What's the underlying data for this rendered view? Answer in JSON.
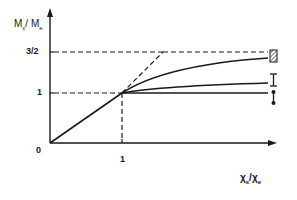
{
  "diagram": {
    "y_axis_label": "M",
    "y_axis_label_sub_num": "x",
    "y_axis_label_sep": "/ M",
    "y_axis_label_sub_den": "e",
    "x_axis_label": "χ",
    "x_axis_label_sub_num": "x",
    "x_axis_label_sep": "/χ",
    "x_axis_label_sub_den": "e",
    "y_ticks": [
      "3/2",
      "1"
    ],
    "x_ticks": [
      "1"
    ],
    "origin_label": "0",
    "legend_symbols": [
      {
        "name": "hatched-box-symbol",
        "level": "top curve"
      },
      {
        "name": "i-beam-symbol",
        "level": "middle curve"
      },
      {
        "name": "dot-line-symbol",
        "level": "bottom curve"
      }
    ],
    "colors": {
      "line": "#1a1a1a",
      "background": "#ffffff"
    }
  }
}
